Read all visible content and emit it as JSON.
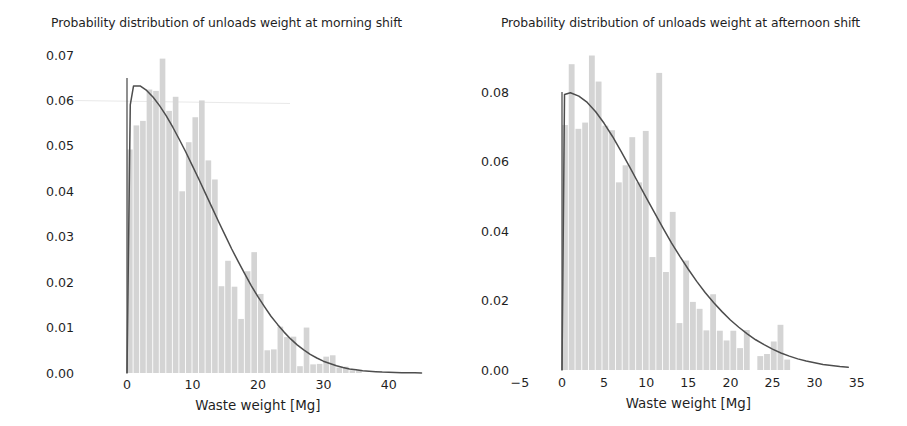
{
  "figure": {
    "background": "#ffffff",
    "bar_color": "#d4d4d4",
    "curve_color": "#4d4d4d",
    "axis_color": "#545454",
    "text_color": "#1f1f1f"
  },
  "panels": [
    {
      "id": "morning",
      "title": "Probability distribution of unloads weight at morning shift",
      "xlabel": "Waste weight [Mg]",
      "ylabel": "",
      "xticks": [
        "0",
        "10",
        "20",
        "30",
        "40"
      ],
      "yticks": [
        "0.00",
        "0.01",
        "0.02",
        "0.03",
        "0.04",
        "0.05",
        "0.06",
        "0.07"
      ]
    },
    {
      "id": "afternoon",
      "title": "Probability distribution of unloads weight at afternoon shift",
      "xlabel": "Waste weight [Mg]",
      "ylabel": "",
      "xticks": [
        "−5",
        "0",
        "5",
        "10",
        "15",
        "20",
        "25",
        "30",
        "35"
      ],
      "yticks": [
        "0.00",
        "0.02",
        "0.04",
        "0.06",
        "0.08"
      ]
    }
  ],
  "chart_data": [
    {
      "type": "bar",
      "id": "morning",
      "title": "Probability distribution of unloads weight at morning shift",
      "xlabel": "Waste weight [Mg]",
      "ylabel": "",
      "xlim": [
        -1.5,
        45.5
      ],
      "ylim": [
        0.0,
        0.0705
      ],
      "xticks": [
        0,
        10,
        20,
        30,
        40
      ],
      "yticks": [
        0.0,
        0.01,
        0.02,
        0.03,
        0.04,
        0.05,
        0.06,
        0.07
      ],
      "grid": false,
      "legend": null,
      "bin_width": 1.0,
      "bin_left_edges": [
        0,
        1,
        2,
        3,
        4,
        5,
        6,
        7,
        8,
        9,
        10,
        11,
        12,
        13,
        14,
        15,
        16,
        17,
        18,
        19,
        20,
        21,
        22,
        23,
        24,
        25,
        26,
        27,
        28,
        29,
        30,
        31,
        32,
        33,
        34,
        35,
        36,
        37,
        38,
        39,
        40
      ],
      "densities": [
        0.0492,
        0.0545,
        0.0555,
        0.0624,
        0.0621,
        0.0692,
        0.0577,
        0.0608,
        0.04,
        0.0508,
        0.0563,
        0.06,
        0.0468,
        0.0426,
        0.0191,
        0.0247,
        0.019,
        0.0119,
        0.0224,
        0.0266,
        0.0174,
        0.005,
        0.0052,
        0.0102,
        0.0079,
        0.008,
        0.0015,
        0.01,
        0.0019,
        0.002,
        0.0036,
        0.0039,
        0.0012,
        0.0014,
        0.0006,
        0.0007,
        0.0,
        0.0,
        0.0,
        0.0,
        0.0
      ],
      "curve": {
        "name": "fitted pdf",
        "x": [
          0,
          0.5,
          1,
          2,
          3,
          4,
          5,
          6,
          7,
          8,
          9,
          10,
          11,
          12,
          13,
          14,
          15,
          16,
          17,
          18,
          19,
          20,
          21,
          22,
          23,
          24,
          25,
          26,
          27,
          28,
          29,
          30,
          31,
          32,
          33,
          34,
          35,
          36,
          37,
          38,
          39,
          40,
          41,
          42,
          43,
          44,
          45
        ],
        "y": [
          0.0,
          0.059,
          0.0632,
          0.0632,
          0.0622,
          0.0607,
          0.0588,
          0.0566,
          0.0541,
          0.0514,
          0.0486,
          0.0456,
          0.0426,
          0.0395,
          0.0364,
          0.0333,
          0.0303,
          0.0273,
          0.0245,
          0.0218,
          0.0192,
          0.0168,
          0.0146,
          0.0125,
          0.0107,
          0.009,
          0.0075,
          0.0062,
          0.0051,
          0.0041,
          0.0033,
          0.0026,
          0.0021,
          0.0016,
          0.0012,
          0.0009,
          0.0007,
          0.0005,
          0.0004,
          0.0003,
          0.0002,
          0.00015,
          0.0001,
          7e-05,
          5e-05,
          3e-05,
          2e-05
        ]
      }
    },
    {
      "type": "bar",
      "id": "afternoon",
      "title": "Probability distribution of unloads weight at afternoon shift",
      "xlabel": "Waste weight [Mg]",
      "ylabel": "",
      "xlim": [
        -7,
        36
      ],
      "ylim": [
        0.0,
        0.0905
      ],
      "xticks": [
        -5,
        0,
        5,
        10,
        15,
        20,
        25,
        30,
        35
      ],
      "yticks": [
        0.0,
        0.02,
        0.04,
        0.06,
        0.08
      ],
      "grid": false,
      "legend": null,
      "bin_width": 0.8,
      "bin_left_edges": [
        0,
        0.8,
        1.6,
        2.4,
        3.2,
        4.0,
        4.8,
        5.6,
        6.4,
        7.2,
        8.0,
        8.8,
        9.6,
        10.4,
        11.2,
        12.0,
        12.8,
        13.6,
        14.4,
        15.2,
        16.0,
        16.8,
        17.6,
        18.4,
        19.2,
        20.0,
        20.8,
        21.6,
        22.4,
        23.2,
        24.0,
        24.8,
        25.6,
        26.4,
        27.2,
        28.0
      ],
      "densities": [
        0.0705,
        0.088,
        0.0694,
        0.0712,
        0.0905,
        0.083,
        0.0703,
        0.069,
        0.054,
        0.0589,
        0.067,
        0.054,
        0.0688,
        0.0325,
        0.0855,
        0.0282,
        0.0455,
        0.0135,
        0.0315,
        0.0196,
        0.0176,
        0.0114,
        0.0218,
        0.0113,
        0.0085,
        0.0113,
        0.0063,
        0.0115,
        0.0,
        0.004,
        0.0046,
        0.0082,
        0.013,
        0.003,
        0.0,
        0.0
      ],
      "curve": {
        "name": "fitted pdf",
        "x": [
          0,
          0.3,
          1,
          2,
          3,
          4,
          5,
          6,
          7,
          8,
          9,
          10,
          11,
          12,
          13,
          14,
          15,
          16,
          17,
          18,
          19,
          20,
          21,
          22,
          23,
          24,
          25,
          26,
          27,
          28,
          29,
          30,
          31,
          32,
          33,
          34
        ],
        "y": [
          0.0,
          0.0793,
          0.0798,
          0.0788,
          0.077,
          0.0743,
          0.071,
          0.0672,
          0.063,
          0.0586,
          0.0541,
          0.0496,
          0.0452,
          0.0408,
          0.0366,
          0.0327,
          0.029,
          0.0255,
          0.0223,
          0.0194,
          0.0168,
          0.0144,
          0.0123,
          0.0104,
          0.0087,
          0.0073,
          0.006,
          0.0049,
          0.004,
          0.0032,
          0.0026,
          0.0021,
          0.0016,
          0.0013,
          0.001,
          0.0008
        ]
      }
    }
  ]
}
